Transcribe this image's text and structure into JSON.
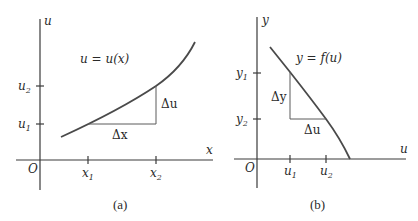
{
  "panel_a": {
    "caption": "(a)",
    "vertical_axis_label": "u",
    "horizontal_axis_label": "x",
    "origin_label": "O",
    "curve_label": "u = u(x)",
    "y_ticks": [
      {
        "label": "u",
        "sub": "2"
      },
      {
        "label": "u",
        "sub": "1"
      }
    ],
    "x_ticks": [
      {
        "label": "x",
        "sub": "1"
      },
      {
        "label": "x",
        "sub": "2"
      }
    ],
    "delta_vertical": "Δu",
    "delta_horizontal": "Δx"
  },
  "panel_b": {
    "caption": "(b)",
    "vertical_axis_label": "y",
    "horizontal_axis_label": "u",
    "origin_label": "O",
    "curve_label": "y = f(u)",
    "y_ticks": [
      {
        "label": "y",
        "sub": "1"
      },
      {
        "label": "y",
        "sub": "2"
      }
    ],
    "x_ticks": [
      {
        "label": "u",
        "sub": "1"
      },
      {
        "label": "u",
        "sub": "2"
      }
    ],
    "delta_vertical": "Δy",
    "delta_horizontal": "Δu"
  }
}
